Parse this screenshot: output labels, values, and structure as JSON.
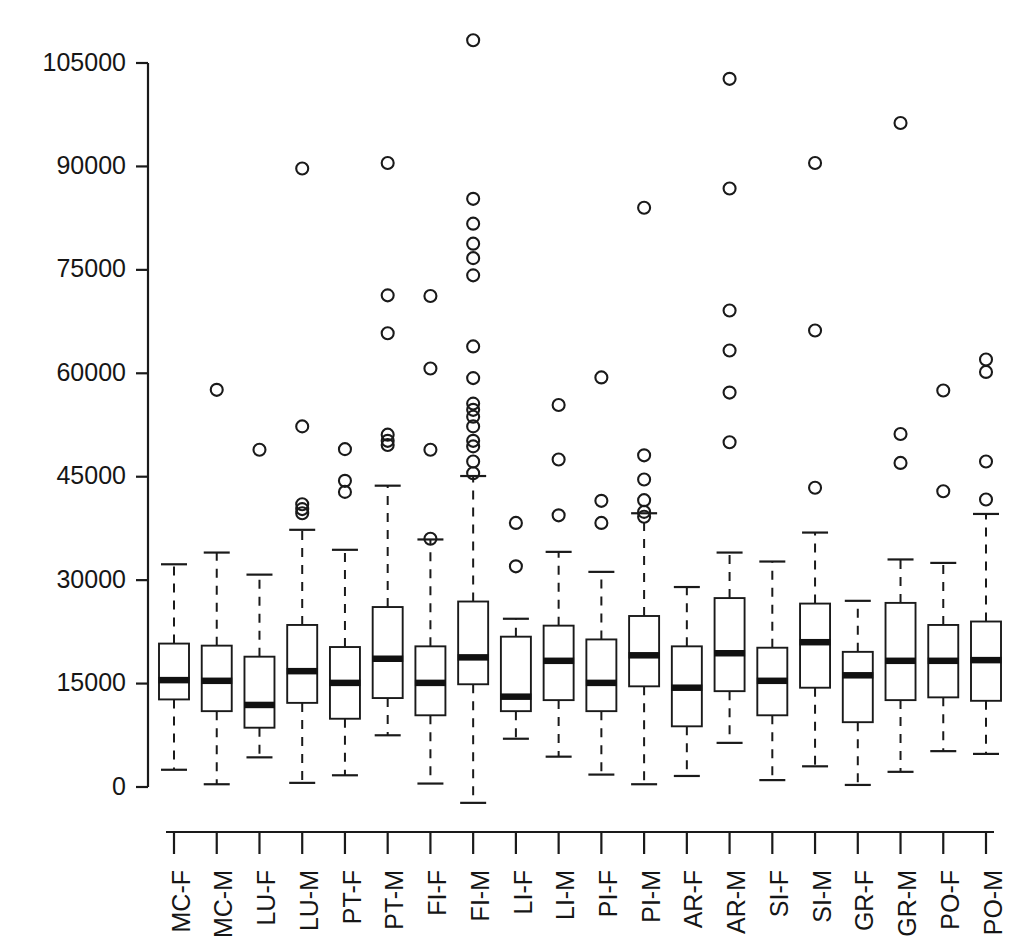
{
  "chart_data": {
    "type": "box",
    "title": "",
    "xlabel": "",
    "ylabel": "",
    "ylim": [
      -4000,
      109000
    ],
    "grid": false,
    "legend": null,
    "y_ticks": [
      0,
      15000,
      30000,
      45000,
      60000,
      75000,
      90000,
      105000
    ],
    "y_tick_labels": [
      "0",
      "15000",
      "30000",
      "45000",
      "60000",
      "75000",
      "90000",
      "105000"
    ],
    "categories": [
      "MC-F",
      "MC-M",
      "LU-F",
      "LU-M",
      "PT-F",
      "PT-M",
      "FI-F",
      "FI-M",
      "LI-F",
      "LI-M",
      "PI-F",
      "PI-M",
      "AR-F",
      "AR-M",
      "SI-F",
      "SI-M",
      "GR-F",
      "GR-M",
      "PO-F",
      "PO-M"
    ],
    "boxes": [
      {
        "label": "MC-F",
        "whisker_low": 2500,
        "q1": 12700,
        "median": 15500,
        "q3": 20800,
        "whisker_high": 32300,
        "outliers": []
      },
      {
        "label": "MC-M",
        "whisker_low": 400,
        "q1": 11000,
        "median": 15400,
        "q3": 20500,
        "whisker_high": 34000,
        "outliers": [
          57600
        ]
      },
      {
        "label": "LU-F",
        "whisker_low": 4300,
        "q1": 8600,
        "median": 11900,
        "q3": 18900,
        "whisker_high": 30800,
        "outliers": [
          48900
        ]
      },
      {
        "label": "LU-M",
        "whisker_low": 600,
        "q1": 12200,
        "median": 16800,
        "q3": 23500,
        "whisker_high": 37300,
        "outliers": [
          89700,
          52300,
          41000,
          39700,
          40300
        ]
      },
      {
        "label": "PT-F",
        "whisker_low": 1700,
        "q1": 9900,
        "median": 15100,
        "q3": 20300,
        "whisker_high": 34400,
        "outliers": [
          49000,
          44400,
          42800
        ]
      },
      {
        "label": "PT-M",
        "whisker_low": 7500,
        "q1": 12900,
        "median": 18600,
        "q3": 26100,
        "whisker_high": 43700,
        "outliers": [
          90500,
          71300,
          65800,
          51100,
          50200,
          49600
        ]
      },
      {
        "label": "FI-F",
        "whisker_low": 500,
        "q1": 10400,
        "median": 15100,
        "q3": 20400,
        "whisker_high": 35900,
        "outliers": [
          71200,
          60700,
          48900,
          36000
        ]
      },
      {
        "label": "FI-M",
        "whisker_low": -2300,
        "q1": 14900,
        "median": 18800,
        "q3": 26900,
        "whisker_high": 45100,
        "outliers": [
          108300,
          85300,
          81700,
          78800,
          76700,
          74200,
          63900,
          59300,
          55600,
          54700,
          53700,
          52300,
          50200,
          49400,
          47200,
          45500
        ]
      },
      {
        "label": "LI-F",
        "whisker_low": 7000,
        "q1": 11000,
        "median": 13100,
        "q3": 21800,
        "whisker_high": 24400,
        "outliers": [
          38300,
          32000
        ]
      },
      {
        "label": "LI-M",
        "whisker_low": 4400,
        "q1": 12600,
        "median": 18300,
        "q3": 23400,
        "whisker_high": 34100,
        "outliers": [
          55400,
          47500,
          39400
        ]
      },
      {
        "label": "PI-F",
        "whisker_low": 1800,
        "q1": 11000,
        "median": 15100,
        "q3": 21400,
        "whisker_high": 31200,
        "outliers": [
          59400,
          41500,
          38300
        ]
      },
      {
        "label": "PI-M",
        "whisker_low": 400,
        "q1": 14600,
        "median": 19100,
        "q3": 24800,
        "whisker_high": 39700,
        "outliers": [
          84000,
          48100,
          44600,
          41600,
          39900,
          39200
        ]
      },
      {
        "label": "AR-F",
        "whisker_low": 1600,
        "q1": 8800,
        "median": 14400,
        "q3": 20400,
        "whisker_high": 29000,
        "outliers": []
      },
      {
        "label": "AR-M",
        "whisker_low": 6400,
        "q1": 13900,
        "median": 19400,
        "q3": 27400,
        "whisker_high": 34000,
        "outliers": [
          102700,
          86800,
          69100,
          63300,
          57200,
          50000
        ]
      },
      {
        "label": "SI-F",
        "whisker_low": 1000,
        "q1": 10400,
        "median": 15400,
        "q3": 20200,
        "whisker_high": 32700,
        "outliers": []
      },
      {
        "label": "SI-M",
        "whisker_low": 3000,
        "q1": 14400,
        "median": 21000,
        "q3": 26600,
        "whisker_high": 36900,
        "outliers": [
          90500,
          66200,
          43400
        ]
      },
      {
        "label": "GR-F",
        "whisker_low": 300,
        "q1": 9400,
        "median": 16200,
        "q3": 19600,
        "whisker_high": 27000,
        "outliers": []
      },
      {
        "label": "GR-M",
        "whisker_low": 2200,
        "q1": 12600,
        "median": 18300,
        "q3": 26700,
        "whisker_high": 33000,
        "outliers": [
          96300,
          51200,
          47000
        ]
      },
      {
        "label": "PO-F",
        "whisker_low": 5200,
        "q1": 13000,
        "median": 18300,
        "q3": 23500,
        "whisker_high": 32500,
        "outliers": [
          57500,
          42900
        ]
      },
      {
        "label": "PO-M",
        "whisker_low": 4800,
        "q1": 12500,
        "median": 18400,
        "q3": 24000,
        "whisker_high": 39600,
        "outliers": [
          62000,
          60200,
          47200,
          41700
        ]
      }
    ]
  },
  "axis": {
    "y_axis_name": "y-axis",
    "x_axis_name": "x-axis"
  }
}
